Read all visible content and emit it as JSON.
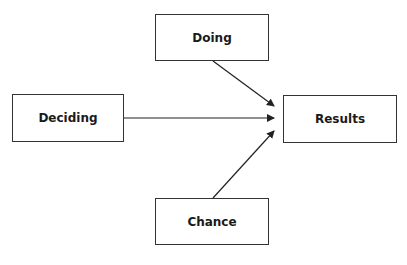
{
  "diagram": {
    "nodes": {
      "doing": {
        "label": "Doing"
      },
      "deciding": {
        "label": "Deciding"
      },
      "results": {
        "label": "Results"
      },
      "chance": {
        "label": "Chance"
      }
    },
    "edges": [
      {
        "from": "Doing",
        "to": "Results"
      },
      {
        "from": "Deciding",
        "to": "Results"
      },
      {
        "from": "Chance",
        "to": "Results"
      }
    ],
    "colors": {
      "stroke": "#222222",
      "background": "#ffffff"
    }
  }
}
